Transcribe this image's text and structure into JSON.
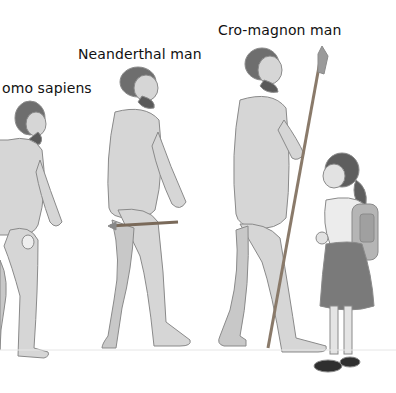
{
  "illustration": {
    "labels": [
      {
        "id": "homo-sapiens",
        "text": "omo sapiens",
        "x": 2,
        "y": 80
      },
      {
        "id": "neanderthal",
        "text": "Neanderthal man",
        "x": 78,
        "y": 46
      },
      {
        "id": "cro-magnon",
        "text": "Cro-magnon man",
        "x": 218,
        "y": 22
      }
    ],
    "figures": [
      "homo-sapiens-figure",
      "neanderthal-figure",
      "cro-magnon-figure",
      "schoolgirl-figure"
    ],
    "colors": {
      "skin": "#d6d6d6",
      "skin_shade": "#bdbdbd",
      "hair": "#6e6e6e",
      "outline": "#8a8a8a",
      "skirt": "#7a7a7a",
      "backpack": "#b5b5b5",
      "blouse": "#ececec",
      "shoes": "#2f2f2f"
    }
  }
}
